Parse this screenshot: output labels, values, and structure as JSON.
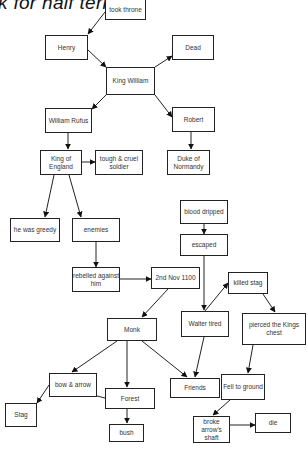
{
  "title": "k for half term",
  "nodes": {
    "took_throne": "took throne",
    "henry": "Henry",
    "dead": "Dead",
    "king_william": "King William",
    "william_rufus": "William Rufus",
    "robert": "Robert",
    "king_of_england": "King of England",
    "tough_cruel_soldier": "tough & cruel soldier",
    "duke_of_normandy": "Duke of Normandy",
    "he_was_greedy": "he was greedy",
    "enemies": "enemies",
    "blood_dripped": "blood dripped",
    "escaped": "escaped",
    "rebelled_against_him": "rebelled against him",
    "nov_1100": "2nd Nov 1100",
    "killed_stag": "killed stag",
    "monk": "Monk",
    "walter_tired": "Walter tired",
    "pierced_kings_chest": "pierced the Kings chest",
    "bow_arrow": "bow & arrow",
    "forest": "Forest",
    "friends": "Friends",
    "fell_to_ground": "Fell to ground",
    "stag": "Stag",
    "broke_arrows_shaft": "broke arrow's shaft",
    "die": "die",
    "bush": "bush"
  },
  "edges": [
    [
      "took_throne",
      "henry"
    ],
    [
      "henry",
      "king_william"
    ],
    [
      "king_william",
      "dead"
    ],
    [
      "king_william",
      "william_rufus"
    ],
    [
      "king_william",
      "robert"
    ],
    [
      "william_rufus",
      "king_of_england"
    ],
    [
      "robert",
      "duke_of_normandy"
    ],
    [
      "king_of_england",
      "tough_cruel_soldier"
    ],
    [
      "king_of_england",
      "he_was_greedy"
    ],
    [
      "king_of_england",
      "enemies"
    ],
    [
      "enemies",
      "rebelled_against_him"
    ],
    [
      "rebelled_against_him",
      "nov_1100"
    ],
    [
      "nov_1100",
      "monk"
    ],
    [
      "blood_dripped",
      "escaped"
    ],
    [
      "escaped",
      "walter_tired"
    ],
    [
      "walter_tired",
      "killed_stag"
    ],
    [
      "killed_stag",
      "pierced_kings_chest"
    ],
    [
      "walter_tired",
      "friends"
    ],
    [
      "monk",
      "friends"
    ],
    [
      "monk",
      "bow_arrow"
    ],
    [
      "monk",
      "forest"
    ],
    [
      "bow_arrow",
      "stag"
    ],
    [
      "bow_arrow",
      "forest"
    ],
    [
      "forest",
      "bush"
    ],
    [
      "pierced_kings_chest",
      "fell_to_ground"
    ],
    [
      "fell_to_ground",
      "broke_arrows_shaft"
    ],
    [
      "broke_arrows_shaft",
      "die"
    ]
  ]
}
